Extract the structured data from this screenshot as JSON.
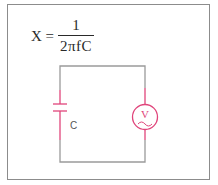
{
  "formula": {
    "lhs": "X =",
    "numerator": "1",
    "denominator": "2πfC"
  },
  "circuit": {
    "capacitor_label": "C",
    "source_label": "V",
    "source_type": "AC voltage source",
    "wire_color": "#9a9a9a",
    "component_color": "#e0457b"
  }
}
